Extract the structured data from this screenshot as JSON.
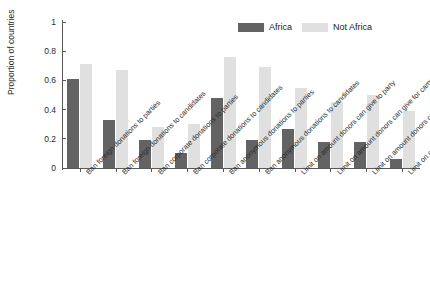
{
  "chart_data": {
    "type": "bar",
    "title": "",
    "subtitle": "",
    "xlabel": "",
    "ylabel": "Proportion of countries",
    "ylim": [
      0,
      1
    ],
    "yticks": [
      "0",
      "0.2",
      "0.4",
      "0.6",
      "0.8",
      "1"
    ],
    "ytick_values": [
      0,
      0.2,
      0.4,
      0.6,
      0.8,
      1
    ],
    "grid": false,
    "legend_position": "top-right",
    "categories": [
      "Ban foreign donations to parties",
      "Ban foreign donations to candidates",
      "Ban corporate donations to parties",
      "Ban corporate donations to candidates",
      "Ban anonymous donations to parties",
      "Ban anonymous donations to candidates",
      "Limit on amount donors can give to party",
      "Limit on amount donors can give for campaign",
      "Limit on amount donors can give to candidate",
      "Limit on contribution to own campaign"
    ],
    "series": [
      {
        "name": "Africa",
        "color": "#636363",
        "values": [
          0.61,
          0.33,
          0.19,
          0.1,
          0.48,
          0.19,
          0.27,
          0.18,
          0.18,
          0.06
        ]
      },
      {
        "name": "Not Africa",
        "color": "#e0e0e0",
        "values": [
          0.71,
          0.67,
          0.28,
          0.3,
          0.76,
          0.69,
          0.55,
          0.45,
          0.5,
          0.39
        ]
      }
    ]
  },
  "legend": {
    "entries": [
      {
        "label": "Africa",
        "color": "#636363"
      },
      {
        "label": "Not Africa",
        "color": "#e0e0e0"
      }
    ]
  },
  "axis": {
    "y_title": "Proportion of countries"
  }
}
